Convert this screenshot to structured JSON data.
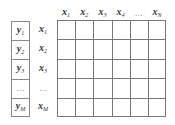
{
  "diagram": {
    "column_headers": [
      {
        "var": "x",
        "sub": "1"
      },
      {
        "var": "x",
        "sub": "2"
      },
      {
        "var": "x",
        "sub": "3"
      },
      {
        "var": "x",
        "sub": "4"
      },
      {
        "ellipsis": "…"
      },
      {
        "var": "x",
        "sub": "N"
      }
    ],
    "y_labels": [
      {
        "var": "y",
        "sub": "1"
      },
      {
        "var": "y",
        "sub": "2"
      },
      {
        "var": "y",
        "sub": "3"
      },
      {
        "ellipsis": "…"
      },
      {
        "var": "y",
        "sub": "M"
      }
    ],
    "row_labels": [
      {
        "var": "x",
        "sub": "1"
      },
      {
        "var": "x",
        "sub": "2"
      },
      {
        "var": "x",
        "sub": "3"
      },
      {
        "ellipsis": "…"
      },
      {
        "var": "x",
        "sub": "M"
      }
    ],
    "grid": {
      "rows": 5,
      "cols": 6
    },
    "line_color": "#777777"
  }
}
